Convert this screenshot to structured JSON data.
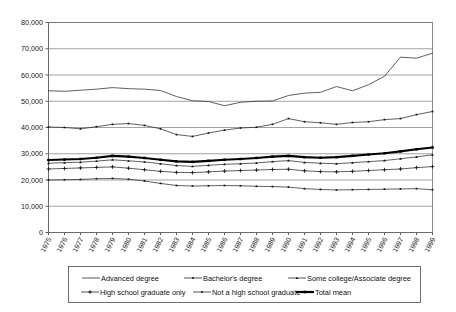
{
  "chart_data": {
    "type": "line",
    "title": "",
    "subtitle": "",
    "xlabel": "",
    "ylabel": "",
    "xlim": [
      1975,
      1999
    ],
    "ylim": [
      0,
      80000
    ],
    "grid": true,
    "legend_position": "bottom",
    "x": [
      1975,
      1976,
      1977,
      1978,
      1979,
      1980,
      1981,
      1982,
      1983,
      1984,
      1985,
      1986,
      1987,
      1988,
      1989,
      1990,
      1991,
      1992,
      1993,
      1994,
      1995,
      1996,
      1997,
      1998,
      1999
    ],
    "xtick_labels": [
      "1975",
      "1976",
      "1977",
      "1978",
      "1979",
      "1980",
      "1981",
      "1982",
      "1983",
      "1984",
      "1985",
      "1986",
      "1987",
      "1988",
      "1989",
      "1990",
      "1991",
      "1992",
      "1993",
      "1994",
      "1995",
      "1996",
      "1997",
      "1998",
      "1999"
    ],
    "ytick_values": [
      0,
      10000,
      20000,
      30000,
      40000,
      50000,
      60000,
      70000,
      80000
    ],
    "ytick_labels": [
      "0",
      "10,000",
      "20,000",
      "30,000",
      "40,000",
      "50,000",
      "60,000",
      "70,000",
      "80,000"
    ],
    "series": [
      {
        "name": "Advanced degree",
        "marker": "none",
        "weight": "thin",
        "values": [
          54000,
          53800,
          54200,
          54600,
          55200,
          54800,
          54600,
          54100,
          51800,
          50200,
          49900,
          48300,
          49600,
          50000,
          50100,
          52200,
          53100,
          53400,
          55600,
          54000,
          56300,
          59500,
          66800,
          66400,
          68300
        ]
      },
      {
        "name": "Bachelor's degree",
        "marker": "square",
        "weight": "thin",
        "values": [
          40200,
          40000,
          39500,
          40300,
          41200,
          41500,
          40800,
          39500,
          37300,
          36600,
          37900,
          39000,
          39800,
          40100,
          41200,
          43400,
          42200,
          41800,
          41200,
          41900,
          42200,
          43000,
          43400,
          44900,
          46100
        ]
      },
      {
        "name": "Some college/Associate degree",
        "marker": "triangle",
        "weight": "thin",
        "values": [
          26400,
          26600,
          26800,
          27200,
          27700,
          27300,
          26900,
          26200,
          25500,
          25200,
          25600,
          26000,
          26200,
          26500,
          27000,
          27400,
          26700,
          26400,
          26200,
          26600,
          27000,
          27400,
          28100,
          28800,
          29600
        ]
      },
      {
        "name": "High school graduate only",
        "marker": "cross",
        "weight": "thin",
        "values": [
          24200,
          24400,
          24600,
          24800,
          25000,
          24500,
          23900,
          23300,
          22900,
          22800,
          23100,
          23400,
          23600,
          23800,
          24000,
          24100,
          23500,
          23200,
          23100,
          23300,
          23600,
          23900,
          24200,
          24700,
          25100
        ]
      },
      {
        "name": "Not a high school graduate",
        "marker": "square",
        "weight": "thin",
        "values": [
          20000,
          20100,
          20200,
          20500,
          20600,
          20300,
          19600,
          18700,
          17900,
          17700,
          17800,
          17900,
          17800,
          17600,
          17500,
          17300,
          16700,
          16400,
          16200,
          16300,
          16400,
          16500,
          16600,
          16700,
          16300
        ]
      },
      {
        "name": "Total mean",
        "marker": "square",
        "weight": "bold",
        "values": [
          27600,
          27800,
          28000,
          28500,
          29200,
          28900,
          28400,
          27700,
          27100,
          26900,
          27300,
          27700,
          28000,
          28400,
          28900,
          29200,
          28700,
          28500,
          28700,
          29200,
          29700,
          30200,
          30900,
          31700,
          32400
        ]
      }
    ]
  },
  "legend": {
    "row1": [
      {
        "label": "Advanced degree",
        "marker": "none"
      },
      {
        "label": "Bachelor's degree",
        "marker": "square"
      },
      {
        "label": "Some college/Associate degree",
        "marker": "triangle"
      }
    ],
    "row2": [
      {
        "label": "High school graduate only",
        "marker": "cross"
      },
      {
        "label": "Not a high school graduate",
        "marker": "square"
      },
      {
        "label": "Total mean",
        "marker": "square-bold"
      }
    ]
  },
  "colors": {
    "line": "#2b2b2b",
    "bold_line": "#000000",
    "grid": "#7a7a7a",
    "frame": "#6f6f6f",
    "background": "#ffffff"
  }
}
